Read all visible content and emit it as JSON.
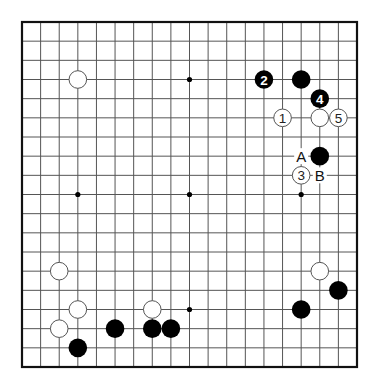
{
  "diagram": {
    "type": "go-board",
    "size": 19,
    "colors": {
      "background": "#ffffff",
      "line": "#555555",
      "border": "#111111",
      "black_stone": "#000000",
      "white_stone": "#ffffff",
      "stone_outline": "#555555",
      "star_point": "#000000"
    },
    "star_points": [
      [
        3,
        3
      ],
      [
        9,
        3
      ],
      [
        15,
        3
      ],
      [
        3,
        9
      ],
      [
        9,
        9
      ],
      [
        15,
        9
      ],
      [
        3,
        15
      ],
      [
        9,
        15
      ],
      [
        15,
        15
      ]
    ],
    "stones": [
      {
        "color": "white",
        "col": 3,
        "row": 3,
        "label": ""
      },
      {
        "color": "black",
        "col": 13,
        "row": 3,
        "label": "2"
      },
      {
        "color": "black",
        "col": 15,
        "row": 3,
        "label": ""
      },
      {
        "color": "black",
        "col": 16,
        "row": 4,
        "label": "4"
      },
      {
        "color": "white",
        "col": 14,
        "row": 5,
        "label": "1"
      },
      {
        "color": "white",
        "col": 16,
        "row": 5,
        "label": ""
      },
      {
        "color": "white",
        "col": 17,
        "row": 5,
        "label": "5"
      },
      {
        "color": "black",
        "col": 16,
        "row": 7,
        "label": ""
      },
      {
        "color": "white",
        "col": 15,
        "row": 8,
        "label": "3"
      },
      {
        "color": "white",
        "col": 2,
        "row": 13,
        "label": ""
      },
      {
        "color": "white",
        "col": 16,
        "row": 13,
        "label": ""
      },
      {
        "color": "black",
        "col": 17,
        "row": 14,
        "label": ""
      },
      {
        "color": "white",
        "col": 3,
        "row": 15,
        "label": ""
      },
      {
        "color": "white",
        "col": 7,
        "row": 15,
        "label": ""
      },
      {
        "color": "black",
        "col": 15,
        "row": 15,
        "label": ""
      },
      {
        "color": "white",
        "col": 2,
        "row": 16,
        "label": ""
      },
      {
        "color": "black",
        "col": 5,
        "row": 16,
        "label": ""
      },
      {
        "color": "black",
        "col": 7,
        "row": 16,
        "label": ""
      },
      {
        "color": "black",
        "col": 8,
        "row": 16,
        "label": ""
      },
      {
        "color": "black",
        "col": 3,
        "row": 17,
        "label": ""
      }
    ],
    "point_labels": [
      {
        "col": 15,
        "row": 7,
        "text": "A"
      },
      {
        "col": 16,
        "row": 8,
        "text": "B"
      }
    ]
  }
}
